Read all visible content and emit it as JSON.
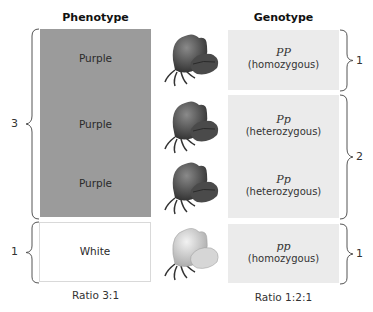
{
  "headers": {
    "phenotype": "Phenotype",
    "genotype": "Genotype"
  },
  "phenotype": {
    "rows": [
      {
        "label": "Purple",
        "color": "#9b9b9b"
      },
      {
        "label": "Purple",
        "color": "#9b9b9b"
      },
      {
        "label": "Purple",
        "color": "#9b9b9b"
      },
      {
        "label": "White",
        "color": "#ffffff"
      }
    ],
    "groups": [
      {
        "count": "3"
      },
      {
        "count": "1"
      }
    ],
    "ratio": "Ratio 3:1"
  },
  "flowers": [
    {
      "icon": "purple-flower-icon"
    },
    {
      "icon": "purple-flower-icon"
    },
    {
      "icon": "purple-flower-icon"
    },
    {
      "icon": "white-flower-icon"
    }
  ],
  "genotype": {
    "rows": [
      {
        "alleles": "PP",
        "type": "(homozygous)"
      },
      {
        "alleles": "Pp",
        "type": "(heterozygous)"
      },
      {
        "alleles": "Pp",
        "type": "(heterozygous)"
      },
      {
        "alleles": "pp",
        "type": "(homozygous)"
      }
    ],
    "groups": [
      {
        "count": "1"
      },
      {
        "count": "2"
      },
      {
        "count": "1"
      }
    ],
    "ratio": "Ratio 1:2:1"
  }
}
